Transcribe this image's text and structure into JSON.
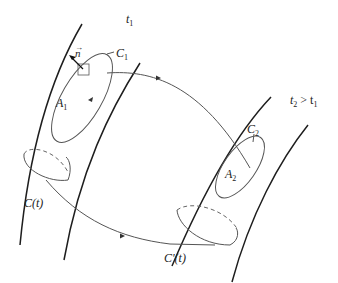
{
  "labels": {
    "t1": "t",
    "t1_sub": "1",
    "t2": "t",
    "t2_sub": "2",
    "t2_rel": " > t",
    "t2_rel_sub": "1",
    "C1": "C",
    "C1_sub": "1",
    "C2": "C",
    "C2_sub": "2",
    "A1": "A",
    "A1_sub": "1",
    "A2": "A",
    "A2_sub": "2",
    "n": "n",
    "n_arrow": "→",
    "Ct": "C(t)",
    "Cpt": "C'(t)"
  },
  "colors": {
    "stroke_dark": "#1e1e1e",
    "stroke_thin": "#555555",
    "background": "#ffffff"
  }
}
